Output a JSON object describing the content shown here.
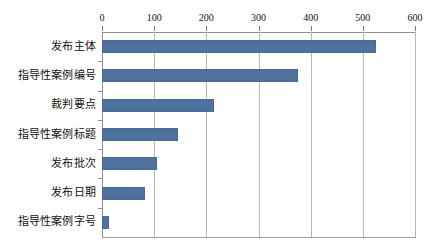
{
  "chart_data": {
    "type": "bar",
    "orientation": "horizontal",
    "title": "",
    "subtitle": "",
    "xlabel": "",
    "ylabel": "",
    "categories": [
      "发布主体",
      "指导性案例编号",
      "裁判要点",
      "指导性案例标题",
      "发布批次",
      "发布日期",
      "指导性案例字号"
    ],
    "values": [
      525,
      375,
      215,
      145,
      105,
      82,
      13
    ],
    "xlim": [
      0,
      600
    ],
    "xticks": [
      0,
      100,
      200,
      300,
      400,
      500,
      600
    ],
    "xtick_labels": [
      "0",
      "100",
      "200",
      "300",
      "400",
      "500",
      "600"
    ],
    "xaxis_position": "top",
    "grid": true,
    "grid_axis": "x",
    "legend": false,
    "legend_position": "none",
    "bar_color": "#4f719e",
    "grid_color": "#b8b8b8",
    "axis_color": "#8f8f8f",
    "background_color": "#ffffff",
    "text_color": "#111111"
  }
}
